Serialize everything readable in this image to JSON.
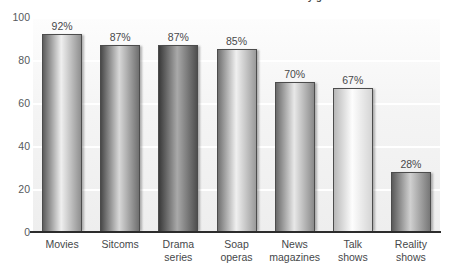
{
  "chart_data": {
    "type": "bar",
    "title": "Percent of teens who watch television by genre",
    "categories": [
      "Movies",
      "Sitcoms",
      "Drama series",
      "Soap operas",
      "News magazines",
      "Talk shows",
      "Reality shows"
    ],
    "category_lines": [
      [
        "Movies"
      ],
      [
        "Sitcoms"
      ],
      [
        "Drama",
        "series"
      ],
      [
        "Soap",
        "operas"
      ],
      [
        "News",
        "magazines"
      ],
      [
        "Talk",
        "shows"
      ],
      [
        "Reality",
        "shows"
      ]
    ],
    "values": [
      92,
      87,
      87,
      85,
      70,
      67,
      28
    ],
    "value_labels": [
      "92%",
      "87%",
      "87%",
      "85%",
      "70%",
      "67%",
      "28%"
    ],
    "xlabel": "",
    "ylabel": "",
    "ylim": [
      0,
      100
    ],
    "yticks": [
      0,
      20,
      40,
      60,
      80,
      100
    ],
    "ytick_labels": [
      "0",
      "20",
      "40",
      "60",
      "80",
      "100"
    ],
    "grid": true,
    "grid_color": "#ffffff",
    "legend": "none",
    "bar_shades": [
      {
        "from": "#5d5d5d",
        "mid": "#efefef",
        "to": "#8f8f8f"
      },
      {
        "from": "#4a4a4a",
        "mid": "#d8d8d8",
        "to": "#6f6f6f"
      },
      {
        "from": "#3a3a3a",
        "mid": "#a9a9a9",
        "to": "#4f4f4f"
      },
      {
        "from": "#707070",
        "mid": "#f0f0f0",
        "to": "#9a9a9a"
      },
      {
        "from": "#6a6a6a",
        "mid": "#e8e8e8",
        "to": "#8a8a8a"
      },
      {
        "from": "#b8b8b8",
        "mid": "#fdfdfd",
        "to": "#d5d5d5"
      },
      {
        "from": "#5a5a5a",
        "mid": "#d0d0d0",
        "to": "#777777"
      }
    ],
    "axis_color": "#2c2c2c",
    "text_color": "#48484a",
    "background": "#ffffff",
    "plot_background": "#f3f3f3"
  }
}
